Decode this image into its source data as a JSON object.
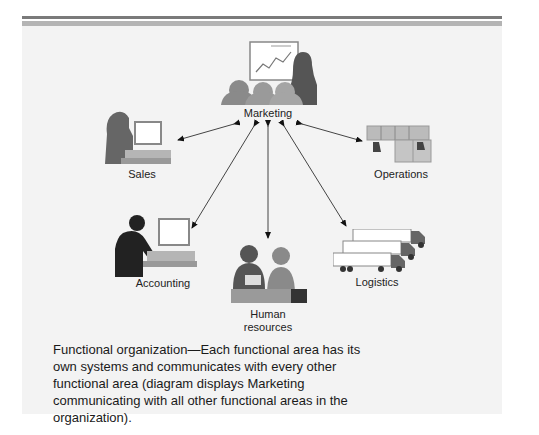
{
  "figure": {
    "nodes": {
      "marketing": {
        "label": "Marketing",
        "icon": "presentation-icon"
      },
      "sales": {
        "label": "Sales",
        "icon": "headset-computer-icon"
      },
      "operations": {
        "label": "Operations",
        "icon": "factory-seats-icon"
      },
      "accounting": {
        "label": "Accounting",
        "icon": "computer-worker-icon"
      },
      "human_resources": {
        "label_line1": "Human",
        "label_line2": "resources",
        "icon": "meeting-icon"
      },
      "logistics": {
        "label": "Logistics",
        "icon": "trucks-icon"
      }
    },
    "edges": [
      {
        "from": "Marketing",
        "to": "Sales",
        "bidirectional": true
      },
      {
        "from": "Marketing",
        "to": "Operations",
        "bidirectional": true
      },
      {
        "from": "Marketing",
        "to": "Accounting",
        "bidirectional": true
      },
      {
        "from": "Marketing",
        "to": "Human resources",
        "bidirectional": true
      },
      {
        "from": "Marketing",
        "to": "Logistics",
        "bidirectional": true
      }
    ],
    "caption": "Functional organization—Each functional area has its own systems and communicates with every other functional area (diagram displays Marketing communicating with all other functional areas in the organization)."
  },
  "colors": {
    "panel": "#f3f3f3",
    "rule_dark": "#7a7a7a",
    "rule_light": "#b4b4b4"
  }
}
